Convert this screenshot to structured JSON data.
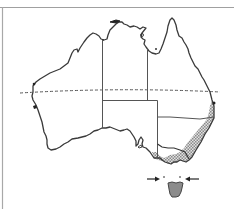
{
  "figure": {
    "colors": {
      "background": "#ffffff",
      "frame": "#9a9a9a",
      "coastline": "#3a3a3a",
      "state_border": "#555555",
      "tropic_line": "#6a6a6a",
      "stipple_fill": "#b8b8b8",
      "tasmania_fill": "#8c8c8c",
      "arrow": "#333333"
    },
    "features": {
      "tropic_line": "dashed line (Tropic of Capricorn)",
      "shaded_region": "stippled area along south-east coast",
      "tasmania": "shaded island",
      "arrows": [
        "arrow pointing east toward Bass Strait",
        "arrow pointing west toward Bass Strait"
      ]
    }
  }
}
